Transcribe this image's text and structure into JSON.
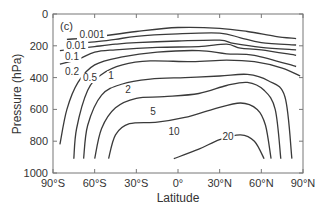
{
  "chart_data": {
    "type": "contour",
    "panel_label": "(c)",
    "title": "",
    "xlabel": "Latitude",
    "ylabel": "Pressure (hPa)",
    "x_ticks": [
      "90°S",
      "60°S",
      "30°S",
      "0°",
      "30°N",
      "60°N",
      "90°N"
    ],
    "x_tick_values": [
      -90,
      -60,
      -30,
      0,
      30,
      60,
      90
    ],
    "y_ticks": [
      "0",
      "200",
      "400",
      "600",
      "800",
      "1000"
    ],
    "y_tick_values": [
      0,
      200,
      400,
      600,
      800,
      1000
    ],
    "xlim": [
      -90,
      90
    ],
    "ylim": [
      1000,
      0
    ],
    "y_inverted": true,
    "grid": false,
    "contour_levels": [
      0.001,
      0.01,
      0.1,
      0.2,
      0.5,
      1,
      2,
      5,
      10,
      20
    ],
    "contour_labels": [
      "0.001",
      "0.01",
      "0.1",
      "0.2",
      "0.5",
      "1",
      "2",
      "5",
      "10",
      "20"
    ],
    "contours": [
      {
        "level": "0.001",
        "points": [
          [
            -80,
            160
          ],
          [
            -60,
            145
          ],
          [
            -30,
            110
          ],
          [
            0,
            85
          ],
          [
            30,
            90
          ],
          [
            50,
            110
          ],
          [
            70,
            140
          ],
          [
            85,
            155
          ]
        ]
      },
      {
        "level": "0.01",
        "points": [
          [
            -80,
            190
          ],
          [
            -60,
            175
          ],
          [
            -45,
            160
          ],
          [
            -30,
            140
          ],
          [
            0,
            125
          ],
          [
            30,
            120
          ],
          [
            45,
            150
          ],
          [
            60,
            180
          ],
          [
            85,
            195
          ]
        ]
      },
      {
        "level": "0.1",
        "points": [
          [
            -85,
            230
          ],
          [
            -60,
            205
          ],
          [
            -45,
            190
          ],
          [
            -30,
            180
          ],
          [
            0,
            170
          ],
          [
            30,
            165
          ],
          [
            40,
            185
          ],
          [
            60,
            210
          ],
          [
            85,
            225
          ]
        ]
      },
      {
        "level": "0.2",
        "points": [
          [
            -85,
            315
          ],
          [
            -72,
            285
          ],
          [
            -60,
            240
          ],
          [
            -45,
            225
          ],
          [
            -15,
            210
          ],
          [
            15,
            205
          ],
          [
            35,
            190
          ],
          [
            45,
            215
          ],
          [
            60,
            225
          ],
          [
            85,
            260
          ]
        ]
      },
      {
        "level": "0.5",
        "points": [
          [
            -85,
            820
          ],
          [
            -80,
            600
          ],
          [
            -72,
            430
          ],
          [
            -60,
            320
          ],
          [
            -40,
            270
          ],
          [
            -15,
            240
          ],
          [
            15,
            230
          ],
          [
            35,
            250
          ],
          [
            55,
            260
          ],
          [
            85,
            330
          ]
        ]
      },
      {
        "level": "1",
        "points": [
          [
            -75,
            910
          ],
          [
            -73,
            720
          ],
          [
            -65,
            480
          ],
          [
            -55,
            380
          ],
          [
            -40,
            320
          ],
          [
            -20,
            295
          ],
          [
            10,
            300
          ],
          [
            35,
            290
          ],
          [
            55,
            300
          ],
          [
            75,
            340
          ],
          [
            88,
            390
          ]
        ]
      },
      {
        "level": "2",
        "points": [
          [
            -68,
            910
          ],
          [
            -65,
            700
          ],
          [
            -55,
            510
          ],
          [
            -40,
            440
          ],
          [
            -20,
            410
          ],
          [
            5,
            400
          ],
          [
            30,
            390
          ],
          [
            50,
            380
          ],
          [
            65,
            420
          ],
          [
            77,
            520
          ],
          [
            82,
            910
          ]
        ]
      },
      {
        "level": "5",
        "points": [
          [
            -60,
            910
          ],
          [
            -55,
            720
          ],
          [
            -45,
            590
          ],
          [
            -30,
            530
          ],
          [
            -10,
            520
          ],
          [
            15,
            500
          ],
          [
            35,
            450
          ],
          [
            50,
            430
          ],
          [
            62,
            480
          ],
          [
            70,
            600
          ],
          [
            74,
            910
          ]
        ]
      },
      {
        "level": "10",
        "points": [
          [
            -50,
            910
          ],
          [
            -45,
            760
          ],
          [
            -35,
            690
          ],
          [
            -15,
            680
          ],
          [
            5,
            650
          ],
          [
            25,
            600
          ],
          [
            45,
            560
          ],
          [
            57,
            600
          ],
          [
            63,
            700
          ],
          [
            67,
            910
          ]
        ]
      },
      {
        "level": "20",
        "points": [
          [
            -3,
            910
          ],
          [
            15,
            850
          ],
          [
            30,
            790
          ],
          [
            45,
            760
          ],
          [
            55,
            800
          ],
          [
            62,
            910
          ]
        ]
      }
    ]
  }
}
